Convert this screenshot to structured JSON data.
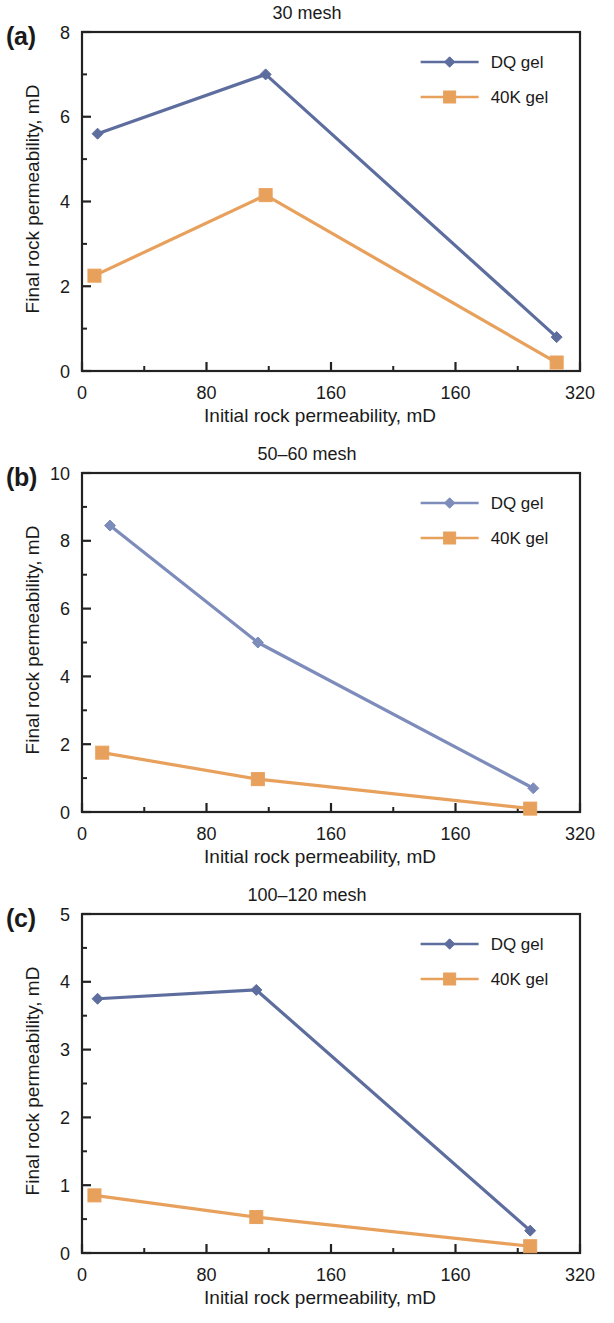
{
  "figure": {
    "panel_labels": [
      "(a)",
      "(b)",
      "(c)"
    ],
    "shared": {
      "xlabel": "Initial rock permeability, mD",
      "ylabel": "Final rock permeability, mD",
      "xticks": [
        "0",
        "80",
        "160",
        "160",
        "320"
      ],
      "xtick_values": [
        0,
        80,
        160,
        240,
        320
      ],
      "xlim": [
        0,
        320
      ],
      "legend": [
        {
          "name": "DQ gel",
          "color": "#5d6d9e",
          "marker": "diamond"
        },
        {
          "name": "40K gel",
          "color": "#e8a15c",
          "marker": "square"
        }
      ]
    }
  },
  "chart_data": [
    {
      "type": "line",
      "panel": "(a)",
      "title": "30 mesh",
      "xlabel": "Initial rock permeability, mD",
      "ylabel": "Final rock permeability, mD",
      "xlim": [
        0,
        320
      ],
      "ylim": [
        0,
        8
      ],
      "xticks": [
        "0",
        "80",
        "160",
        "160",
        "320"
      ],
      "yticks": [
        "0",
        "2",
        "4",
        "6",
        "8"
      ],
      "ytick_values": [
        0,
        2,
        4,
        6,
        8
      ],
      "y_minor_step": 1,
      "grid": false,
      "legend_position": "top-right",
      "series": [
        {
          "name": "DQ gel",
          "color": "#5d6d9e",
          "marker": "diamond",
          "x": [
            10,
            118,
            305
          ],
          "values": [
            5.6,
            7.0,
            0.8
          ]
        },
        {
          "name": "40K gel",
          "color": "#e8a15c",
          "marker": "square",
          "x": [
            8,
            118,
            305
          ],
          "values": [
            2.25,
            4.15,
            0.2
          ]
        }
      ]
    },
    {
      "type": "line",
      "panel": "(b)",
      "title": "50–60 mesh",
      "xlabel": "Initial rock permeability, mD",
      "ylabel": "Final rock permeability, mD",
      "xlim": [
        0,
        320
      ],
      "ylim": [
        0,
        10
      ],
      "xticks": [
        "0",
        "80",
        "160",
        "160",
        "320"
      ],
      "yticks": [
        "0",
        "2",
        "4",
        "6",
        "8",
        "10"
      ],
      "ytick_values": [
        0,
        2,
        4,
        6,
        8,
        10
      ],
      "y_minor_step": 1,
      "grid": false,
      "legend_position": "top-right",
      "series": [
        {
          "name": "DQ gel",
          "color": "#7d8cba",
          "marker": "diamond",
          "x": [
            18,
            113,
            290
          ],
          "values": [
            8.45,
            5.0,
            0.7
          ]
        },
        {
          "name": "40K gel",
          "color": "#e8a15c",
          "marker": "square",
          "x": [
            13,
            113,
            288
          ],
          "values": [
            1.75,
            0.97,
            0.1
          ]
        }
      ]
    },
    {
      "type": "line",
      "panel": "(c)",
      "title": "100–120 mesh",
      "xlabel": "Initial rock permeability, mD",
      "ylabel": "Final rock permeability, mD",
      "xlim": [
        0,
        320
      ],
      "ylim": [
        0,
        5
      ],
      "xticks": [
        "0",
        "80",
        "160",
        "160",
        "320"
      ],
      "yticks": [
        "0",
        "1",
        "2",
        "3",
        "4",
        "5"
      ],
      "ytick_values": [
        0,
        1,
        2,
        3,
        4,
        5
      ],
      "y_minor_step": 0.5,
      "grid": false,
      "legend_position": "top-right",
      "series": [
        {
          "name": "DQ gel",
          "color": "#5d6d9e",
          "marker": "diamond",
          "x": [
            10,
            112,
            288
          ],
          "values": [
            3.75,
            3.88,
            0.33
          ]
        },
        {
          "name": "40K gel",
          "color": "#e8a15c",
          "marker": "square",
          "x": [
            8,
            112,
            288
          ],
          "values": [
            0.85,
            0.53,
            0.1
          ]
        }
      ]
    }
  ]
}
